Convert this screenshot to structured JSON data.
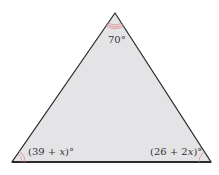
{
  "diagram": {
    "type": "triangle",
    "fill_color": "#e4e4e7",
    "edge_color": "#2b2b2b",
    "arc_color": "#e08a8a",
    "vertices": {
      "top": {
        "angle_label": "70°",
        "arcs": 3
      },
      "bottom_left": {
        "angle_label_prefix": "(39 + ",
        "angle_label_var": "x",
        "angle_label_suffix": ")°",
        "arcs": 2
      },
      "bottom_right": {
        "angle_label_prefix": "(26 + 2",
        "angle_label_var": "x",
        "angle_label_suffix": ")°",
        "arcs": 1
      }
    }
  }
}
